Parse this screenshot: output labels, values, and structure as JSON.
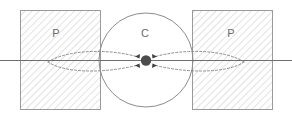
{
  "figure": {
    "title": "",
    "background_color": "#ffffff",
    "width": 292,
    "height": 117,
    "labels": {
      "left_region": "P",
      "center_region": "C",
      "right_region": "P"
    },
    "colors": {
      "rect_stroke": "#9a9a9a",
      "hatch_line": "#c9c9c9",
      "circle_stroke": "#8d8d8d",
      "axis_line": "#6f6f6f",
      "curve_stroke": "#8a8a8a",
      "center_dot": "#4d4d4d",
      "arrow_head": "#3f3f3f",
      "label_text": "#6b6b6b"
    },
    "geometry": {
      "left_rect": {
        "x": 20,
        "y": 10,
        "width": 80,
        "height": 100
      },
      "right_rect": {
        "x": 192,
        "y": 10,
        "width": 80,
        "height": 100
      },
      "circle": {
        "cx": 146,
        "cy": 60,
        "r": 47
      },
      "center_dot": {
        "cx": 146,
        "cy": 60,
        "r": 5
      },
      "axis": {
        "x1": 0,
        "y1": 60,
        "x2": 292,
        "y2": 60
      }
    },
    "label_positions": {
      "left_region": {
        "x": 56,
        "y": 34
      },
      "center_region": {
        "x": 145,
        "y": 34
      },
      "right_region": {
        "x": 231,
        "y": 34
      }
    }
  }
}
